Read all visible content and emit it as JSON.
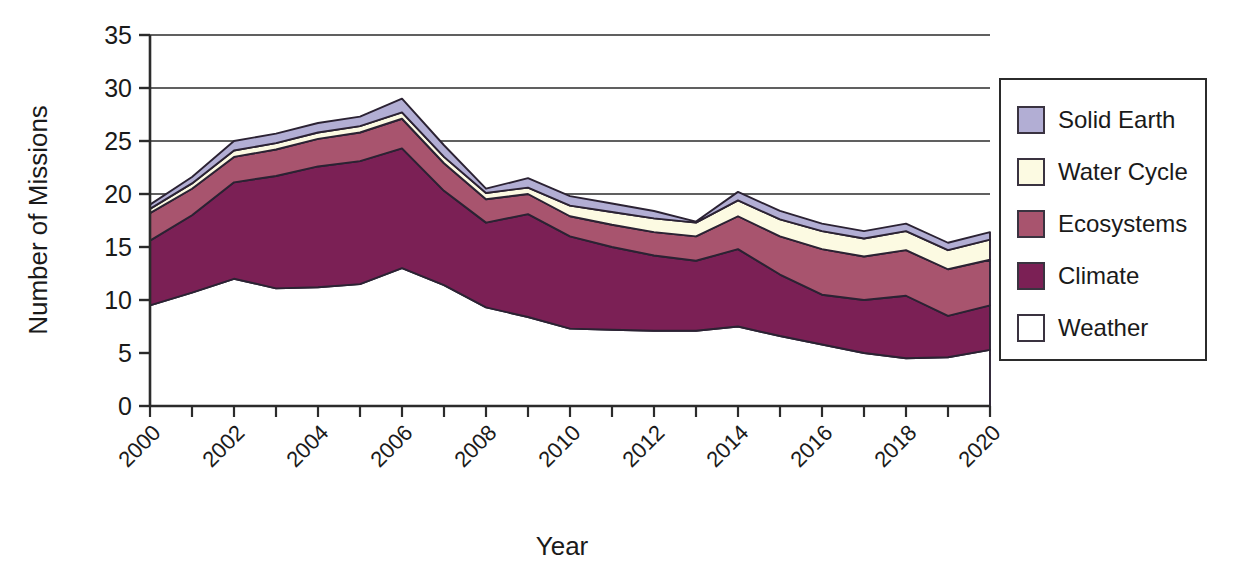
{
  "chart_data": {
    "type": "area",
    "stacked": true,
    "title": "",
    "xlabel": "Year",
    "ylabel": "Number of Missions",
    "xlim": [
      2000,
      2020
    ],
    "ylim": [
      0,
      35
    ],
    "ytick_step": 5,
    "xtick_step": 1,
    "xtick_label_step": 2,
    "grid": "horizontal",
    "legend_position": "right",
    "x": [
      2000,
      2001,
      2002,
      2003,
      2004,
      2005,
      2006,
      2007,
      2008,
      2009,
      2010,
      2011,
      2012,
      2013,
      2014,
      2015,
      2016,
      2017,
      2018,
      2019,
      2020
    ],
    "categories": [
      "2000",
      "2001",
      "2002",
      "2003",
      "2004",
      "2005",
      "2006",
      "2007",
      "2008",
      "2009",
      "2010",
      "2011",
      "2012",
      "2013",
      "2014",
      "2015",
      "2016",
      "2017",
      "2018",
      "2019",
      "2020"
    ],
    "ytick_labels": [
      "0",
      "5",
      "10",
      "15",
      "20",
      "25",
      "30",
      "35"
    ],
    "xtick_labels": [
      "2000",
      "",
      "2002",
      "",
      "2004",
      "",
      "2006",
      "",
      "2008",
      "",
      "2010",
      "",
      "2012",
      "",
      "2014",
      "",
      "2016",
      "",
      "2018",
      "",
      "2020"
    ],
    "series": [
      {
        "name": "Weather",
        "color": "#ffffff",
        "values": [
          9.5,
          10.7,
          12.0,
          11.1,
          11.2,
          11.5,
          13.0,
          11.4,
          9.3,
          8.4,
          7.3,
          7.2,
          7.1,
          7.1,
          7.5,
          6.6,
          5.8,
          5.0,
          4.5,
          4.6,
          5.3
        ]
      },
      {
        "name": "Climate",
        "color": "#7b2055",
        "values": [
          6.1,
          7.3,
          9.1,
          10.6,
          11.4,
          11.6,
          11.3,
          8.9,
          8.0,
          9.7,
          8.7,
          7.8,
          7.1,
          6.6,
          7.3,
          5.8,
          4.7,
          5.0,
          5.9,
          3.9,
          4.2
        ]
      },
      {
        "name": "Ecosystems",
        "color": "#a8546e",
        "values": [
          2.6,
          2.5,
          2.4,
          2.5,
          2.6,
          2.7,
          2.8,
          2.6,
          2.2,
          1.9,
          1.9,
          2.1,
          2.2,
          2.3,
          3.1,
          3.6,
          4.3,
          4.1,
          4.3,
          4.4,
          4.3
        ]
      },
      {
        "name": "Water Cycle",
        "color": "#fcfae2",
        "values": [
          0.4,
          0.5,
          0.6,
          0.6,
          0.6,
          0.6,
          0.6,
          0.6,
          0.6,
          0.6,
          1.0,
          1.2,
          1.3,
          1.3,
          1.5,
          1.6,
          1.7,
          1.7,
          1.8,
          1.8,
          1.9
        ]
      },
      {
        "name": "Solid Earth",
        "color": "#b2aed4",
        "values": [
          0.4,
          0.6,
          0.9,
          0.9,
          0.9,
          0.9,
          1.3,
          1.1,
          0.4,
          0.9,
          0.9,
          0.8,
          0.7,
          0.1,
          0.8,
          0.8,
          0.7,
          0.7,
          0.7,
          0.7,
          0.7
        ]
      }
    ]
  },
  "legend": {
    "items": [
      {
        "label": "Solid Earth",
        "color": "#b2aed4"
      },
      {
        "label": "Water Cycle",
        "color": "#fcfae2"
      },
      {
        "label": "Ecosystems",
        "color": "#a8546e"
      },
      {
        "label": "Climate",
        "color": "#7b2055"
      },
      {
        "label": "Weather",
        "color": "#ffffff"
      }
    ]
  },
  "axes": {
    "y_title": "Number of Missions",
    "x_title": "Year"
  }
}
